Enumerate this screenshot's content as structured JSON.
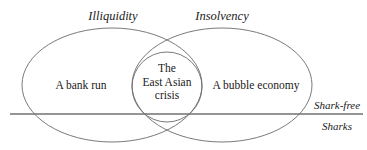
{
  "diagram": {
    "type": "venn-diagram",
    "title_visible": false,
    "stroke_color": "#6b6b6b",
    "divider_color": "#707070",
    "text_color": "#1a1a1a",
    "background_color": "#ffffff",
    "sets": [
      {
        "id": "illiquidity",
        "heading": "Illiquidity",
        "exclusive_label": "A bank run",
        "center_x": 112,
        "center_y": 85,
        "radius_x": 90,
        "radius_y": 57
      },
      {
        "id": "insolvency",
        "heading": "Insolvency",
        "exclusive_label": "A bubble economy",
        "center_x": 222,
        "center_y": 85,
        "radius_x": 90,
        "radius_y": 57
      }
    ],
    "intersection": {
      "id": "east-asian-crisis",
      "lines": [
        "The",
        "East Asian",
        "crisis"
      ],
      "label": "The East Asian crisis",
      "circle": {
        "center_x": 167,
        "center_y": 87,
        "radius": 35
      }
    },
    "divider": {
      "id": "waterline",
      "orientation": "horizontal",
      "y": 114,
      "x_start": 10,
      "x_end": 363,
      "above_label": "Shark-free",
      "below_label": "Sharks"
    }
  }
}
